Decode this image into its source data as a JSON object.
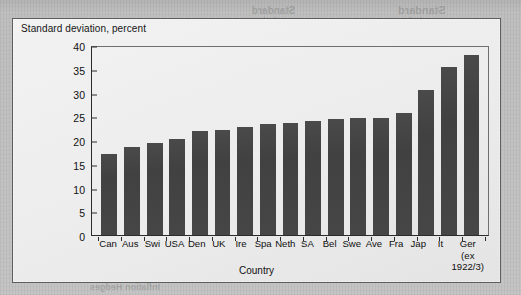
{
  "figure": {
    "axis_title_y": "Standard deviation, percent",
    "axis_title_x": "Country"
  },
  "bleed_text": [
    {
      "text": "Standard",
      "x": 398,
      "y": 4,
      "size": 11
    },
    {
      "text": "Deviation",
      "x": 398,
      "y": 16,
      "size": 9
    },
    {
      "text": "Standard",
      "x": 252,
      "y": 5,
      "size": 10
    },
    {
      "text": "Deviation",
      "x": 252,
      "y": 16,
      "size": 9
    },
    {
      "text": "Market",
      "x": 318,
      "y": 26,
      "size": 9
    },
    {
      "text": "Stocks",
      "x": 195,
      "y": 26,
      "size": 9
    },
    {
      "text": "(%)",
      "x": 258,
      "y": 27,
      "size": 8
    },
    {
      "text": "Canada",
      "x": 345,
      "y": 42,
      "size": 9
    },
    {
      "text": "22.4",
      "x": 268,
      "y": 42,
      "size": 8
    },
    {
      "text": "UKM",
      "x": 200,
      "y": 42,
      "size": 8
    },
    {
      "text": "17.7",
      "x": 150,
      "y": 42,
      "size": 8
    },
    {
      "text": "(0)",
      "x": 152,
      "y": 28,
      "size": 8
    },
    {
      "text": "USA",
      "x": 345,
      "y": 57,
      "size": 9
    },
    {
      "text": "17.3",
      "x": 268,
      "y": 57,
      "size": 8
    },
    {
      "text": "Neth",
      "x": 200,
      "y": 57,
      "size": 8
    },
    {
      "text": "19.5",
      "x": 150,
      "y": 57,
      "size": 8
    },
    {
      "text": "Germany",
      "x": 345,
      "y": 72,
      "size": 9
    },
    {
      "text": "24.2",
      "x": 268,
      "y": 72,
      "size": 8
    },
    {
      "text": "Japan",
      "x": 200,
      "y": 72,
      "size": 8
    },
    {
      "text": "2nd",
      "x": 152,
      "y": 72,
      "size": 8
    },
    {
      "text": "ation Bridges Risk",
      "x": 250,
      "y": 262,
      "size": 13
    },
    {
      "text": "Inflation Hedges",
      "x": 90,
      "y": 282,
      "size": 9
    }
  ],
  "chart_data": {
    "type": "bar",
    "title": "",
    "xlabel": "Country",
    "ylabel": "Standard deviation, percent",
    "ylim": [
      0,
      40
    ],
    "yticks": [
      0,
      5,
      10,
      15,
      20,
      25,
      30,
      35,
      40
    ],
    "grid": false,
    "legend": "none",
    "bar_color": "#444444",
    "categories": [
      "Can",
      "Aus",
      "Swi",
      "USA",
      "Den",
      "UK",
      "Ire",
      "Spa",
      "Neth",
      "SA",
      "Bel",
      "Swe",
      "Ave",
      "Fra",
      "Jap",
      "It",
      "Ger"
    ],
    "category_sublabels": {
      "Ger": "(ex\n1922/3)"
    },
    "values": [
      17.0,
      18.5,
      19.3,
      20.3,
      21.8,
      22.1,
      22.8,
      23.3,
      23.5,
      24.0,
      24.4,
      24.6,
      24.7,
      25.7,
      30.6,
      35.3,
      37.9
    ]
  }
}
